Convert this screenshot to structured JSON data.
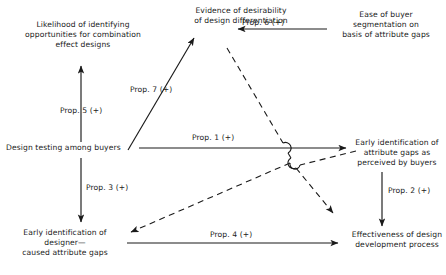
{
  "diagram": {
    "nodes": [
      {
        "id": "combination-effect",
        "label": "Likelihood of identifying\nopportunities for combination\neffect designs"
      },
      {
        "id": "design-differentiation",
        "label": "Evidence of desirability\nof design differentiation"
      },
      {
        "id": "buyer-segmentation",
        "label": "Ease of buyer\nsegmentation on\nbasis of attribute gaps"
      },
      {
        "id": "design-testing",
        "label": "Design testing among buyers"
      },
      {
        "id": "buyer-attribute-gaps",
        "label": "Early identification of\nattribute gaps as\nperceived by buyers"
      },
      {
        "id": "designer-attribute-gaps",
        "label": "Early identification of\ndesigner—\ncaused attribute gaps"
      },
      {
        "id": "design-development",
        "label": "Effectiveness of design\ndevelopment process"
      }
    ],
    "edges": [
      {
        "id": "prop-5",
        "label": "Prop. 5 (+)",
        "style": "solid",
        "from": "design-testing",
        "to": "combination-effect"
      },
      {
        "id": "prop-7",
        "label": "Prop. 7 (+)",
        "style": "solid",
        "from": "design-testing",
        "to": "design-differentiation"
      },
      {
        "id": "prop-6",
        "label": "Prop. 6 (+)",
        "style": "solid",
        "from": "buyer-segmentation",
        "to": "design-differentiation"
      },
      {
        "id": "prop-1",
        "label": "Prop. 1 (+)",
        "style": "solid",
        "from": "design-testing",
        "to": "buyer-attribute-gaps"
      },
      {
        "id": "prop-3",
        "label": "Prop. 3 (+)",
        "style": "solid",
        "from": "design-testing",
        "to": "designer-attribute-gaps"
      },
      {
        "id": "prop-2",
        "label": "Prop. 2 (+)",
        "style": "solid",
        "from": "buyer-attribute-gaps",
        "to": "design-development"
      },
      {
        "id": "prop-4",
        "label": "Prop. 4 (+)",
        "style": "solid",
        "from": "designer-attribute-gaps",
        "to": "design-development"
      },
      {
        "id": "dashed-differentiation-development",
        "label": "",
        "style": "dashed",
        "from": "design-differentiation",
        "to": "design-development"
      },
      {
        "id": "dashed-buyer-gaps-designer-gaps",
        "label": "",
        "style": "dashed",
        "from": "buyer-attribute-gaps",
        "to": "designer-attribute-gaps"
      }
    ],
    "colors": {
      "line": "#1a1a1a",
      "text": "#1a1a1a",
      "background": "#ffffff"
    }
  }
}
